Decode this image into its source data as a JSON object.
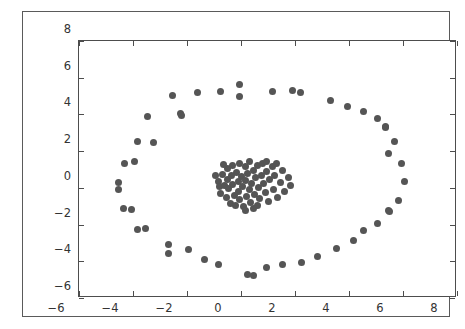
{
  "chart_data": {
    "type": "scatter",
    "title": "",
    "xlabel": "",
    "ylabel": "",
    "xlim": [
      -6,
      8
    ],
    "ylim": [
      -6,
      8
    ],
    "xticks": [
      -6,
      -4,
      -2,
      0,
      2,
      4,
      6,
      8
    ],
    "yticks": [
      -6,
      -4,
      -2,
      0,
      2,
      4,
      6,
      8
    ],
    "xtick_labels": [
      "−6",
      "−4",
      "−2",
      "0",
      "2",
      "4",
      "6",
      "8"
    ],
    "ytick_labels": [
      "−6",
      "−4",
      "−2",
      "0",
      "2",
      "4",
      "6",
      "8"
    ],
    "grid": false,
    "legend": null,
    "marker": "circle",
    "marker_color": "#555555",
    "marker_size_px": 7,
    "background_color": "#ffffff",
    "axes_color": "#4d4d4d",
    "series": [
      {
        "name": "outer-ring",
        "color": "#555555",
        "points": [
          [
            -2.55,
            5.05
          ],
          [
            -1.6,
            5.2
          ],
          [
            -0.75,
            5.25
          ],
          [
            -0.05,
            5.65
          ],
          [
            -0.05,
            5.0
          ],
          [
            1.15,
            5.25
          ],
          [
            1.9,
            5.3
          ],
          [
            2.2,
            5.2
          ],
          [
            3.3,
            4.75
          ],
          [
            3.95,
            4.45
          ],
          [
            4.55,
            4.15
          ],
          [
            5.05,
            3.8
          ],
          [
            -3.45,
            3.9
          ],
          [
            -2.25,
            4.05
          ],
          [
            -2.2,
            3.95
          ],
          [
            5.35,
            3.35
          ],
          [
            5.35,
            3.3
          ],
          [
            5.7,
            2.55
          ],
          [
            -3.85,
            2.55
          ],
          [
            -3.25,
            2.45
          ],
          [
            5.45,
            1.85
          ],
          [
            5.95,
            1.35
          ],
          [
            -4.3,
            1.35
          ],
          [
            -3.95,
            1.45
          ],
          [
            6.05,
            0.35
          ],
          [
            -4.55,
            0.3
          ],
          [
            -4.55,
            -0.1
          ],
          [
            5.85,
            -0.7
          ],
          [
            5.45,
            -1.25
          ],
          [
            5.5,
            -1.3
          ],
          [
            -4.35,
            -1.15
          ],
          [
            -4.05,
            -1.2
          ],
          [
            5.05,
            -1.95
          ],
          [
            4.55,
            -2.35
          ],
          [
            -3.85,
            -2.25
          ],
          [
            -3.55,
            -2.2
          ],
          [
            4.15,
            -2.85
          ],
          [
            3.55,
            -3.3
          ],
          [
            -2.7,
            -3.1
          ],
          [
            -2.7,
            -3.55
          ],
          [
            -1.95,
            -3.35
          ],
          [
            2.85,
            -3.75
          ],
          [
            2.25,
            -4.05
          ],
          [
            -1.35,
            -3.9
          ],
          [
            -0.85,
            -4.2
          ],
          [
            1.55,
            -4.2
          ],
          [
            0.95,
            -4.35
          ],
          [
            0.25,
            -4.7
          ],
          [
            0.45,
            -4.75
          ]
        ]
      },
      {
        "name": "inner-cluster",
        "color": "#555555",
        "points": [
          [
            -0.85,
            0.35
          ],
          [
            -0.8,
            0.05
          ],
          [
            -0.75,
            -0.3
          ],
          [
            -0.7,
            0.75
          ],
          [
            -0.6,
            0.15
          ],
          [
            -0.55,
            -0.55
          ],
          [
            -0.5,
            1.05
          ],
          [
            -0.5,
            0.45
          ],
          [
            -0.45,
            -0.05
          ],
          [
            -0.4,
            -0.85
          ],
          [
            -0.35,
            0.65
          ],
          [
            -0.3,
            1.2
          ],
          [
            -0.3,
            0.2
          ],
          [
            -0.25,
            -0.4
          ],
          [
            -0.2,
            -0.95
          ],
          [
            -0.15,
            0.85
          ],
          [
            -0.1,
            0.35
          ],
          [
            -0.1,
            -0.2
          ],
          [
            -0.05,
            1.35
          ],
          [
            -0.05,
            -0.65
          ],
          [
            0.0,
            0.6
          ],
          [
            0.05,
            0.05
          ],
          [
            0.1,
            -1.0
          ],
          [
            0.15,
            1.15
          ],
          [
            0.15,
            0.4
          ],
          [
            0.2,
            -0.45
          ],
          [
            0.25,
            0.8
          ],
          [
            0.3,
            -0.1
          ],
          [
            0.3,
            1.45
          ],
          [
            0.35,
            -0.8
          ],
          [
            0.4,
            0.25
          ],
          [
            0.45,
            0.95
          ],
          [
            0.5,
            -0.35
          ],
          [
            0.55,
            0.55
          ],
          [
            0.6,
            1.2
          ],
          [
            0.6,
            -0.95
          ],
          [
            0.65,
            0.0
          ],
          [
            0.7,
            -0.6
          ],
          [
            0.75,
            0.7
          ],
          [
            0.8,
            1.3
          ],
          [
            0.85,
            0.25
          ],
          [
            0.9,
            -0.25
          ],
          [
            0.95,
            0.9
          ],
          [
            1.0,
            -0.75
          ],
          [
            1.05,
            0.45
          ],
          [
            1.15,
            1.15
          ],
          [
            1.2,
            -0.1
          ],
          [
            1.25,
            0.65
          ],
          [
            1.35,
            -0.5
          ],
          [
            1.45,
            0.3
          ],
          [
            1.55,
            0.95
          ],
          [
            1.6,
            -0.2
          ],
          [
            1.75,
            0.55
          ],
          [
            1.85,
            0.15
          ],
          [
            0.15,
            -1.25
          ],
          [
            -0.65,
            1.25
          ],
          [
            0.95,
            1.45
          ],
          [
            1.3,
            1.35
          ],
          [
            -0.95,
            0.7
          ],
          [
            0.45,
            -1.1
          ]
        ]
      }
    ]
  }
}
